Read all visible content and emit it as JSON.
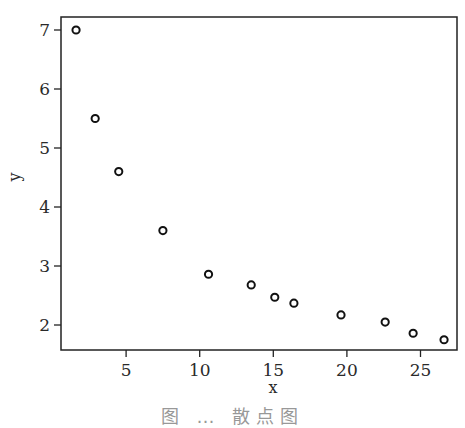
{
  "chart_data": {
    "type": "scatter",
    "title": "",
    "xlabel": "x",
    "ylabel": "y",
    "xlim": [
      0.5,
      27.5
    ],
    "ylim": [
      1.6,
      7.2
    ],
    "xticks": [
      5,
      10,
      15,
      20,
      25
    ],
    "yticks": [
      2,
      3,
      4,
      5,
      6,
      7
    ],
    "grid": false,
    "legend": null,
    "marker": "open-circle",
    "series": [
      {
        "name": "data",
        "x": [
          1.6,
          2.9,
          4.5,
          7.5,
          10.6,
          13.5,
          15.1,
          16.4,
          19.6,
          22.6,
          24.5,
          26.6
        ],
        "y": [
          7.0,
          5.5,
          4.6,
          3.6,
          2.86,
          2.68,
          2.47,
          2.37,
          2.17,
          2.05,
          1.86,
          1.75
        ]
      }
    ]
  },
  "caption": "图 … 散点图"
}
